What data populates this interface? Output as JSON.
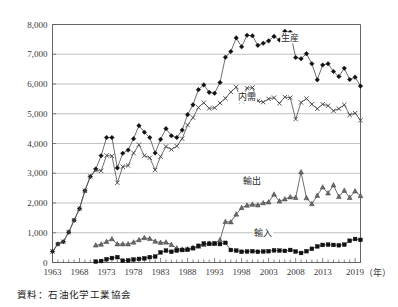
{
  "figure": {
    "source_note": "資料：石油化学工業協会",
    "axis_unit_label": "（年）"
  },
  "chart_data": {
    "type": "line",
    "title": "",
    "xlabel": "（年）",
    "ylabel": "",
    "ylim": [
      0,
      8000
    ],
    "xlim": [
      1963,
      2020
    ],
    "grid": true,
    "legend_position": "inline-annotations",
    "ytick_labels": [
      "0",
      "1,000",
      "2,000",
      "3,000",
      "4,000",
      "5,000",
      "6,000",
      "7,000",
      "8,000"
    ],
    "ytick_values": [
      0,
      1000,
      2000,
      3000,
      4000,
      5000,
      6000,
      7000,
      8000
    ],
    "xtick_labels": [
      "1963",
      "1968",
      "1973",
      "1978",
      "1983",
      "1988",
      "1993",
      "1998",
      "2003",
      "2008",
      "2013",
      "2019"
    ],
    "xtick_values": [
      1963,
      1968,
      1973,
      1978,
      1983,
      1988,
      1993,
      1998,
      2003,
      2008,
      2013,
      2019
    ],
    "x": [
      1963,
      1964,
      1965,
      1966,
      1967,
      1968,
      1969,
      1970,
      1971,
      1972,
      1973,
      1974,
      1975,
      1976,
      1977,
      1978,
      1979,
      1980,
      1981,
      1982,
      1983,
      1984,
      1985,
      1986,
      1987,
      1988,
      1989,
      1990,
      1991,
      1992,
      1993,
      1994,
      1995,
      1996,
      1997,
      1998,
      1999,
      2000,
      2001,
      2002,
      2003,
      2004,
      2005,
      2006,
      2007,
      2008,
      2009,
      2010,
      2011,
      2012,
      2013,
      2014,
      2015,
      2016,
      2017,
      2018,
      2019,
      2020
    ],
    "series": [
      {
        "name": "生産",
        "label": "生産",
        "marker": "diamond",
        "label_x": 2007,
        "label_y": 7450,
        "values": [
          370,
          620,
          700,
          1020,
          1420,
          1810,
          2410,
          2890,
          3140,
          3590,
          4200,
          4200,
          3180,
          3670,
          3780,
          4160,
          4600,
          4380,
          4200,
          3680,
          4140,
          4500,
          4260,
          4200,
          4450,
          4970,
          5300,
          5810,
          5970,
          5720,
          5690,
          6050,
          6900,
          7090,
          7550,
          7250,
          7640,
          7620,
          7300,
          7370,
          7450,
          7600,
          7480,
          7770,
          7740,
          6890,
          6850,
          7020,
          6680,
          6140,
          6640,
          6680,
          6420,
          6250,
          6530,
          6150,
          6230,
          5930
        ]
      },
      {
        "name": "内需",
        "label": "内需",
        "marker": "cross",
        "label_x": 1999,
        "label_y": 5450,
        "values": [
          370,
          620,
          700,
          1020,
          1420,
          1810,
          2410,
          2890,
          3100,
          3080,
          3600,
          3580,
          2680,
          3220,
          3260,
          3680,
          3960,
          3590,
          3520,
          3110,
          3560,
          3900,
          3800,
          3910,
          4160,
          4620,
          4870,
          5210,
          5370,
          5180,
          5200,
          5360,
          5520,
          5730,
          5900,
          5420,
          5860,
          5880,
          5430,
          5390,
          5500,
          5540,
          5350,
          5560,
          5540,
          4820,
          5380,
          5510,
          5320,
          5170,
          5320,
          5270,
          5100,
          5170,
          5300,
          4960,
          5020,
          4780
        ]
      },
      {
        "name": "輸出",
        "label": "輸出",
        "marker": "triangle",
        "label_x": 2000,
        "label_y": 2650,
        "values": [
          0,
          0,
          0,
          0,
          0,
          0,
          0,
          0,
          580,
          610,
          700,
          790,
          620,
          620,
          620,
          680,
          760,
          830,
          800,
          710,
          670,
          680,
          600,
          480,
          440,
          450,
          500,
          540,
          600,
          640,
          640,
          760,
          1370,
          1360,
          1620,
          1840,
          1920,
          1950,
          1930,
          2000,
          2030,
          2290,
          2060,
          2130,
          2200,
          2180,
          3040,
          2170,
          1970,
          2250,
          2530,
          2330,
          2600,
          2210,
          2420,
          2180,
          2400,
          2240
        ]
      },
      {
        "name": "輸入",
        "label": "輸入",
        "marker": "square",
        "label_x": 2002,
        "label_y": 900,
        "values": [
          0,
          0,
          0,
          0,
          0,
          0,
          0,
          0,
          30,
          50,
          110,
          150,
          180,
          60,
          70,
          100,
          120,
          140,
          180,
          200,
          340,
          400,
          360,
          400,
          420,
          430,
          480,
          560,
          640,
          630,
          640,
          620,
          660,
          420,
          400,
          360,
          370,
          380,
          360,
          370,
          380,
          410,
          400,
          390,
          420,
          370,
          320,
          380,
          460,
          540,
          590,
          600,
          590,
          580,
          600,
          730,
          790,
          760
        ]
      }
    ]
  }
}
